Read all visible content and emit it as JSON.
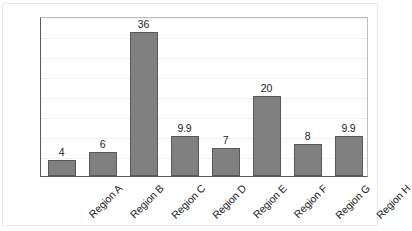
{
  "chart_data": {
    "type": "bar",
    "title": "",
    "subtitle": "",
    "xlabel": "",
    "ylabel": "",
    "categories": [
      "Region A",
      "Region B",
      "Region C",
      "Region D",
      "Region E",
      "Region F",
      "Region G",
      "Region H"
    ],
    "values": [
      4,
      6,
      36,
      9.9,
      7,
      20,
      8,
      9.9
    ],
    "value_labels": [
      "4",
      "6",
      "36",
      "9.9",
      "7",
      "20",
      "8",
      "9.9"
    ],
    "ylim": [
      0,
      40
    ],
    "ytick_values": [
      0,
      5,
      10,
      15,
      20,
      25,
      30,
      35,
      40
    ],
    "ytick_labels": [
      "0",
      "5",
      "10",
      "15",
      "20",
      "25",
      "30",
      "35",
      "40"
    ],
    "grid": true,
    "grid_axis": "y",
    "legend": false,
    "legend_position": "none",
    "bar_color": "#808080",
    "bar_edge_color": "#585858",
    "axis_color": "#5c5c5c",
    "gridline_color": "#f1f1f1",
    "background_color": "#ffffff",
    "xtick_label_rotation": -45
  }
}
